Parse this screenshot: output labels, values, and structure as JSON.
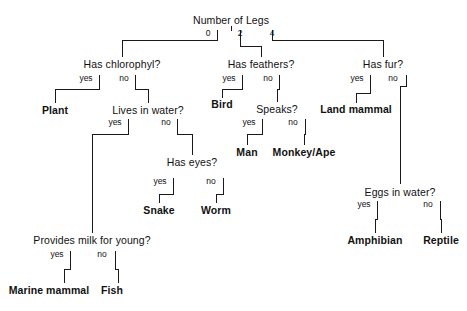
{
  "diagram": {
    "title": "Number of Legs",
    "type": "decision-tree",
    "nodes": [
      {
        "id": "root",
        "kind": "question",
        "text": "Number of Legs",
        "x": 231,
        "y": 22
      },
      {
        "id": "chlorophyl",
        "kind": "question",
        "text": "Has chlorophyl?",
        "x": 122,
        "y": 66
      },
      {
        "id": "feathers",
        "kind": "question",
        "text": "Has feathers?",
        "x": 261,
        "y": 66
      },
      {
        "id": "fur",
        "kind": "question",
        "text": "Has fur?",
        "x": 383,
        "y": 66
      },
      {
        "id": "plant",
        "kind": "leaf",
        "text": "Plant",
        "x": 55,
        "y": 111
      },
      {
        "id": "lives-in-water",
        "kind": "question",
        "text": "Lives in water?",
        "x": 148,
        "y": 111
      },
      {
        "id": "bird",
        "kind": "leaf",
        "text": "Bird",
        "x": 222,
        "y": 105
      },
      {
        "id": "speaks",
        "kind": "question",
        "text": "Speaks?",
        "x": 277,
        "y": 110
      },
      {
        "id": "land-mammal",
        "kind": "leaf",
        "text": "Land mammal",
        "x": 356,
        "y": 110
      },
      {
        "id": "man",
        "kind": "leaf",
        "text": "Man",
        "x": 247,
        "y": 152
      },
      {
        "id": "monkey-ape",
        "kind": "leaf",
        "text": "Monkey/Ape",
        "x": 304,
        "y": 152
      },
      {
        "id": "has-eyes",
        "kind": "question",
        "text": "Has eyes?",
        "x": 192,
        "y": 163
      },
      {
        "id": "snake",
        "kind": "leaf",
        "text": "Snake",
        "x": 159,
        "y": 211
      },
      {
        "id": "worm",
        "kind": "leaf",
        "text": "Worm",
        "x": 216,
        "y": 211
      },
      {
        "id": "eggs-in-water",
        "kind": "question",
        "text": "Eggs in water?",
        "x": 400,
        "y": 193
      },
      {
        "id": "amphibian",
        "kind": "leaf",
        "text": "Amphibian",
        "x": 375,
        "y": 241
      },
      {
        "id": "reptile",
        "kind": "leaf",
        "text": "Reptile",
        "x": 441,
        "y": 241
      },
      {
        "id": "provides-milk",
        "kind": "question",
        "text": "Provides milk for young?",
        "x": 92,
        "y": 241
      },
      {
        "id": "marine-mammal",
        "kind": "leaf",
        "text": "Marine mammal",
        "x": 49,
        "y": 291
      },
      {
        "id": "fish",
        "kind": "leaf",
        "text": "Fish",
        "x": 112,
        "y": 291
      }
    ],
    "edges": [
      {
        "id": "root-0",
        "from": "root",
        "to": "chlorophyl",
        "label": "0",
        "label_x": 208,
        "label_y": 35
      },
      {
        "id": "root-2",
        "from": "root",
        "to": "feathers",
        "label": "2",
        "label_x": 240,
        "label_y": 35
      },
      {
        "id": "root-4",
        "from": "root",
        "to": "fur",
        "label": "4",
        "label_x": 272,
        "label_y": 35
      },
      {
        "id": "chlorophyl-yes",
        "from": "chlorophyl",
        "to": "plant",
        "label": "yes",
        "label_x": 86,
        "label_y": 80
      },
      {
        "id": "chlorophyl-no",
        "from": "chlorophyl",
        "to": "lives-in-water",
        "label": "no",
        "label_x": 124,
        "label_y": 80
      },
      {
        "id": "feathers-yes",
        "from": "feathers",
        "to": "bird",
        "label": "yes",
        "label_x": 229,
        "label_y": 80
      },
      {
        "id": "feathers-no",
        "from": "feathers",
        "to": "speaks",
        "label": "no",
        "label_x": 268,
        "label_y": 80
      },
      {
        "id": "fur-yes",
        "from": "fur",
        "to": "land-mammal",
        "label": "yes",
        "label_x": 357,
        "label_y": 80
      },
      {
        "id": "fur-no",
        "from": "fur",
        "to": "eggs-in-water",
        "label": "no",
        "label_x": 393,
        "label_y": 80
      },
      {
        "id": "speaks-yes",
        "from": "speaks",
        "to": "man",
        "label": "yes",
        "label_x": 249,
        "label_y": 124
      },
      {
        "id": "speaks-no",
        "from": "speaks",
        "to": "monkey-ape",
        "label": "no",
        "label_x": 293,
        "label_y": 124
      },
      {
        "id": "water-yes",
        "from": "lives-in-water",
        "to": "provides-milk",
        "label": "yes",
        "label_x": 115,
        "label_y": 124
      },
      {
        "id": "water-no",
        "from": "lives-in-water",
        "to": "has-eyes",
        "label": "no",
        "label_x": 166,
        "label_y": 124
      },
      {
        "id": "eyes-yes",
        "from": "has-eyes",
        "to": "snake",
        "label": "yes",
        "label_x": 160,
        "label_y": 183
      },
      {
        "id": "eyes-no",
        "from": "has-eyes",
        "to": "worm",
        "label": "no",
        "label_x": 211,
        "label_y": 183
      },
      {
        "id": "eggs-yes",
        "from": "eggs-in-water",
        "to": "amphibian",
        "label": "yes",
        "label_x": 364,
        "label_y": 206
      },
      {
        "id": "eggs-no",
        "from": "eggs-in-water",
        "to": "reptile",
        "label": "no",
        "label_x": 428,
        "label_y": 206
      },
      {
        "id": "milk-yes",
        "from": "provides-milk",
        "to": "marine-mammal",
        "label": "yes",
        "label_x": 57,
        "label_y": 256
      },
      {
        "id": "milk-no",
        "from": "provides-milk",
        "to": "fish",
        "label": "no",
        "label_x": 102,
        "label_y": 256
      }
    ],
    "colors": {
      "line": "#1a1a1a",
      "text": "#111111",
      "background": "#ffffff"
    }
  }
}
